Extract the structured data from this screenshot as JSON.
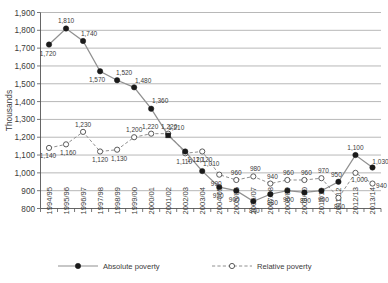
{
  "chart_data": {
    "type": "line",
    "title": "",
    "xlabel": "",
    "ylabel": "Thousands",
    "ylim": [
      800,
      1900
    ],
    "ytick_step": 100,
    "yticks": [
      "800",
      "900",
      "1,000",
      "1,100",
      "1,200",
      "1,300",
      "1,400",
      "1,500",
      "1,600",
      "1,700",
      "1,800",
      "1,900"
    ],
    "grid": true,
    "legend_position": "bottom",
    "categories": [
      "1994/95",
      "1995/96",
      "1996/97",
      "1997/98",
      "1998/99",
      "1999/00",
      "2000/01",
      "2001/02",
      "2002/03",
      "2003/04",
      "2004/05",
      "2005/06",
      "2006/07",
      "2007/08",
      "2008/09",
      "2009/10",
      "2010/11",
      "2011/12",
      "2012/13",
      "2013/14"
    ],
    "series": [
      {
        "name": "Absolute poverty",
        "marker": "filled-circle",
        "line": "solid",
        "values": [
          1720,
          1810,
          1740,
          1570,
          1520,
          1480,
          1360,
          1210,
          1120,
          1010,
          920,
          900,
          840,
          880,
          900,
          890,
          900,
          950,
          1100,
          1030
        ],
        "labels": [
          "1,720",
          "1,810",
          "1,740",
          "1,570",
          "1,520",
          "1,480",
          "1,360",
          "1,210",
          "1,120",
          "1,010",
          "920",
          "900",
          "840",
          "880",
          "900",
          "890",
          "900",
          "950",
          "1,100",
          "1,030"
        ]
      },
      {
        "name": "Relative poverty",
        "marker": "open-circle",
        "line": "dashed",
        "values": [
          1140,
          1160,
          1230,
          1120,
          1130,
          1200,
          1220,
          1220,
          1110,
          1120,
          990,
          960,
          980,
          940,
          960,
          960,
          970,
          860,
          1000,
          940
        ],
        "labels": [
          "1,140",
          "1,160",
          "1,230",
          "1,120",
          "1,130",
          "1,200",
          "1,220",
          "1,220",
          "1,110",
          "1,120",
          "990",
          "960",
          "980",
          "940",
          "960",
          "960",
          "970",
          "860",
          "1,000",
          "940"
        ]
      }
    ],
    "legend": [
      {
        "label": "Absolute poverty",
        "marker": "filled-circle",
        "line": "solid"
      },
      {
        "label": "Relative poverty",
        "marker": "open-circle",
        "line": "dashed"
      }
    ],
    "colors": {
      "line": "#909090",
      "absolute_marker": "#1a1a1a",
      "relative_marker": "#ffffff",
      "grid": "#9a9a9a",
      "axis": "#555555",
      "text": "#3b3b3b"
    }
  }
}
